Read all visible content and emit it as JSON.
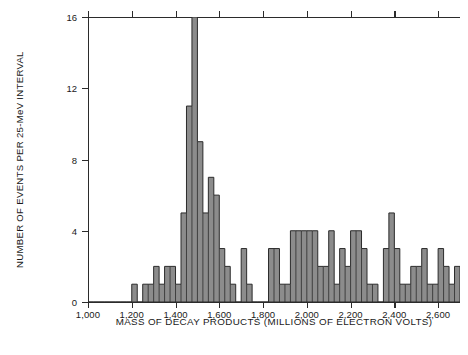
{
  "chart_data": {
    "type": "bar",
    "title": "",
    "subtitle": "",
    "xlabel": "MASS OF DECAY PRODUCTS (MILLIONS OF ELECTRON VOLTS)",
    "ylabel": "NUMBER OF EVENTS PER 25-MeV INTERVAL",
    "xlim": [
      1000,
      2700
    ],
    "ylim": [
      0,
      16
    ],
    "xticks": [
      1000,
      1200,
      1400,
      1600,
      1800,
      2000,
      2200,
      2400,
      2600
    ],
    "xtick_labels": [
      "1,000",
      "1,200",
      "1,400",
      "1,600",
      "1,800",
      "2,000",
      "2,200",
      "2,400",
      "2,600"
    ],
    "yticks": [
      0,
      4,
      8,
      12,
      16
    ],
    "ytick_labels": [
      "0",
      "4",
      "8",
      "12",
      "16"
    ],
    "bin_width": 25,
    "grid": false,
    "legend": null,
    "bar_fill": "#8c8c8c",
    "bar_edge": "#2b2b2b",
    "axis_color": "#2b2b2b",
    "background": "#ffffff",
    "bins": [
      {
        "x": 1000,
        "value": 0
      },
      {
        "x": 1025,
        "value": 0
      },
      {
        "x": 1050,
        "value": 0
      },
      {
        "x": 1075,
        "value": 0
      },
      {
        "x": 1100,
        "value": 0
      },
      {
        "x": 1125,
        "value": 0
      },
      {
        "x": 1150,
        "value": 0
      },
      {
        "x": 1175,
        "value": 0
      },
      {
        "x": 1200,
        "value": 1
      },
      {
        "x": 1225,
        "value": 0
      },
      {
        "x": 1250,
        "value": 1
      },
      {
        "x": 1275,
        "value": 1
      },
      {
        "x": 1300,
        "value": 2
      },
      {
        "x": 1325,
        "value": 1
      },
      {
        "x": 1350,
        "value": 2
      },
      {
        "x": 1375,
        "value": 2
      },
      {
        "x": 1400,
        "value": 1
      },
      {
        "x": 1425,
        "value": 5
      },
      {
        "x": 1450,
        "value": 11
      },
      {
        "x": 1475,
        "value": 16
      },
      {
        "x": 1500,
        "value": 9
      },
      {
        "x": 1525,
        "value": 5
      },
      {
        "x": 1550,
        "value": 7
      },
      {
        "x": 1575,
        "value": 6
      },
      {
        "x": 1600,
        "value": 3
      },
      {
        "x": 1625,
        "value": 2
      },
      {
        "x": 1650,
        "value": 1
      },
      {
        "x": 1675,
        "value": 0
      },
      {
        "x": 1700,
        "value": 3
      },
      {
        "x": 1725,
        "value": 1
      },
      {
        "x": 1750,
        "value": 0
      },
      {
        "x": 1775,
        "value": 0
      },
      {
        "x": 1800,
        "value": 0
      },
      {
        "x": 1825,
        "value": 3
      },
      {
        "x": 1850,
        "value": 3
      },
      {
        "x": 1875,
        "value": 1
      },
      {
        "x": 1900,
        "value": 1
      },
      {
        "x": 1925,
        "value": 4
      },
      {
        "x": 1950,
        "value": 4
      },
      {
        "x": 1975,
        "value": 4
      },
      {
        "x": 2000,
        "value": 4
      },
      {
        "x": 2025,
        "value": 4
      },
      {
        "x": 2050,
        "value": 2
      },
      {
        "x": 2075,
        "value": 2
      },
      {
        "x": 2100,
        "value": 4
      },
      {
        "x": 2125,
        "value": 1
      },
      {
        "x": 2150,
        "value": 3
      },
      {
        "x": 2175,
        "value": 2
      },
      {
        "x": 2200,
        "value": 4
      },
      {
        "x": 2225,
        "value": 4
      },
      {
        "x": 2250,
        "value": 3
      },
      {
        "x": 2275,
        "value": 1
      },
      {
        "x": 2300,
        "value": 1
      },
      {
        "x": 2325,
        "value": 0
      },
      {
        "x": 2350,
        "value": 3
      },
      {
        "x": 2375,
        "value": 5
      },
      {
        "x": 2400,
        "value": 3
      },
      {
        "x": 2425,
        "value": 1
      },
      {
        "x": 2450,
        "value": 1
      },
      {
        "x": 2475,
        "value": 2
      },
      {
        "x": 2500,
        "value": 2
      },
      {
        "x": 2525,
        "value": 3
      },
      {
        "x": 2550,
        "value": 1
      },
      {
        "x": 2575,
        "value": 1
      },
      {
        "x": 2600,
        "value": 3
      },
      {
        "x": 2625,
        "value": 2
      },
      {
        "x": 2650,
        "value": 1
      },
      {
        "x": 2675,
        "value": 2
      }
    ]
  },
  "caption": {
    "text": ""
  }
}
